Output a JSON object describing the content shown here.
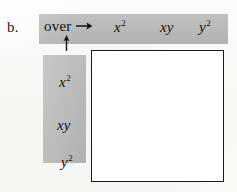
{
  "figure": {
    "item_letter": "b.",
    "instruction_label": "over",
    "right_arrow_glyph": "→",
    "up_arrow_glyph": "↑",
    "shade_color": "#b9b9b9",
    "ink_color": "#1a1a1a",
    "paper_color": "#ffffff"
  },
  "header_row": {
    "name": "over-terms",
    "terms": [
      {
        "base": "x",
        "exponent": "2"
      },
      {
        "base": "xy",
        "exponent": ""
      },
      {
        "base": "y",
        "exponent": "2"
      }
    ]
  },
  "header_column": {
    "name": "down-terms",
    "terms": [
      {
        "base": "x",
        "exponent": "2"
      },
      {
        "base": "xy",
        "exponent": ""
      },
      {
        "base": "y",
        "exponent": "2"
      }
    ]
  },
  "grid": {
    "name": "product-grid",
    "rows": 3,
    "columns": 3,
    "cells": [
      [
        "",
        "",
        ""
      ],
      [
        "",
        "",
        ""
      ],
      [
        "",
        "",
        ""
      ]
    ]
  }
}
